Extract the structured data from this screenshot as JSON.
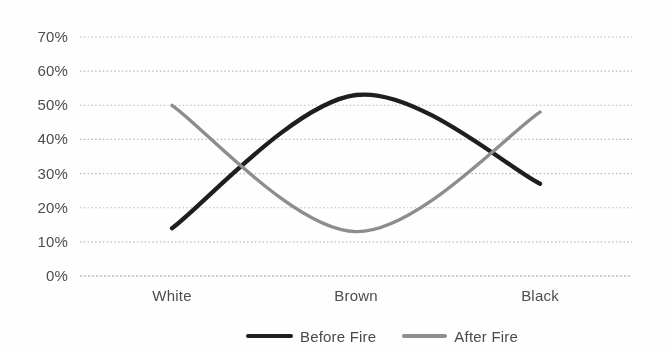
{
  "chart_data": {
    "type": "line",
    "title": "",
    "xlabel": "",
    "ylabel": "",
    "categories": [
      "White",
      "Brown",
      "Black"
    ],
    "series": [
      {
        "name": "Before Fire",
        "values": [
          14,
          53,
          27
        ],
        "color": "#1e1e1e",
        "stroke_width": 4.3
      },
      {
        "name": "After Fire",
        "values": [
          50,
          13,
          48
        ],
        "color": "#8d8d8d",
        "stroke_width": 3.4
      }
    ],
    "ylim": [
      0,
      70
    ],
    "ytick_step": 10,
    "ytick_labels": [
      "0%",
      "10%",
      "20%",
      "30%",
      "40%",
      "50%",
      "60%",
      "70%"
    ],
    "grid": "horizontal-dotted",
    "gridline_color": "#b9b9b9",
    "baseline_color": "#a9a9a9",
    "label_color": "#4d4d4d",
    "line_style": "smooth",
    "legend_position": "bottom",
    "markers": "none"
  }
}
